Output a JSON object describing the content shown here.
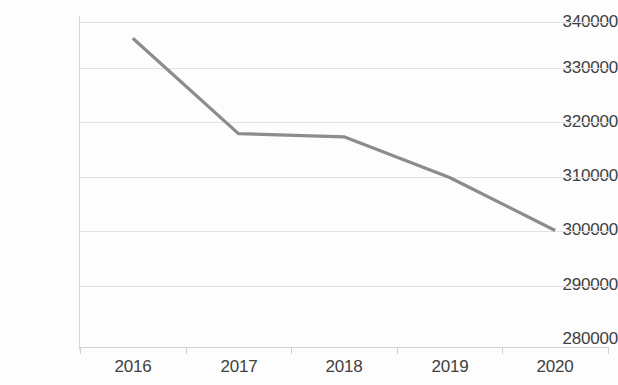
{
  "chart_data": {
    "type": "line",
    "title": "",
    "subtitle": "",
    "xlabel": "",
    "ylabel": "",
    "categories": [
      "2016",
      "2017",
      "2018",
      "2019",
      "2020"
    ],
    "values": [
      337000,
      319400,
      318800,
      311300,
      301500
    ],
    "series": [
      {
        "name": "",
        "values": [
          337000,
          319400,
          318800,
          311300,
          301500
        ],
        "color": "#8c8c8c"
      }
    ],
    "ylim": [
      280000,
      340000
    ],
    "ytick_values": [
      340000,
      330000,
      320000,
      310000,
      300000,
      290000,
      280000
    ],
    "ytick_labels": [
      "340000",
      "330000",
      "320000",
      "310000",
      "300000",
      "290000",
      "280000"
    ],
    "xtick_labels": [
      "2016",
      "2017",
      "2018",
      "2019",
      "2020"
    ],
    "grid": {
      "horizontal": true,
      "vertical": false,
      "color": "#e3e3e3"
    },
    "legend": {
      "visible": false,
      "position": "none",
      "entries": []
    },
    "annotations": [],
    "colors": {
      "line": "#8c8c8c",
      "grid": "#e3e3e3",
      "axis": "#d2d2d2",
      "text": "#404040",
      "background": "#fdfdfd"
    }
  }
}
